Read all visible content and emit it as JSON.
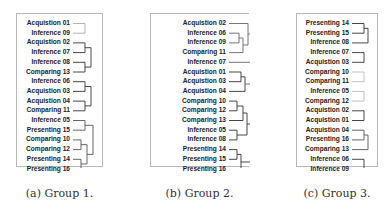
{
  "panels": [
    {
      "id": "a",
      "caption": "(a) Group 1.",
      "labels": [
        "Acquistion 01",
        "Inference 09",
        "Acquistion 02",
        "Inference 07",
        "Inference 08",
        "Comparing 13",
        "Inference 06",
        "Acquistion 03",
        "Acquistion 04",
        "Comparing 11",
        "Inference 05",
        "Presenting 15",
        "Comparing 10",
        "Comparing 12",
        "Presenting 14",
        "Presenting 16"
      ],
      "clusters": [
        {
          "leaves": [
            0,
            1
          ],
          "color": "#aaaaaa"
        },
        {
          "leaves": [
            2,
            3,
            4,
            5
          ],
          "color": "#333333"
        },
        {
          "leaves": [
            6,
            7,
            8,
            9
          ],
          "color": "#333333"
        },
        {
          "leaves": [
            10,
            11,
            12,
            13,
            14,
            15
          ],
          "color": "#555555"
        }
      ]
    },
    {
      "id": "b",
      "caption": "(b) Group 2.",
      "labels": [
        "Acquistion 02",
        "Inference 06",
        "Inference 09",
        "Comparing 11",
        "Inference 07",
        "Acquistion 01",
        "Acquistion 03",
        "Acquistion 04",
        "Comparing 10",
        "Comparing 12",
        "Comparing 13",
        "Inference 05",
        "Inference 08",
        "Presenting 14",
        "Presenting 15",
        "Presenting 16"
      ],
      "clusters": [
        {
          "leaves": [
            0,
            1,
            2,
            3,
            4,
            5,
            6,
            7
          ],
          "color": "#666666"
        },
        {
          "leaves": [
            8,
            9,
            10,
            11,
            12,
            13,
            14,
            15
          ],
          "color": "#333333"
        }
      ]
    },
    {
      "id": "c",
      "caption": "(c) Group 3.",
      "labels": [
        "Presenting 14",
        "Presenting 15",
        "Inference 08",
        "Inference 07",
        "Acquistion 03",
        "Comparing 10",
        "Comparing 11",
        "Inference 05",
        "Comparing 12",
        "Acquistion 02",
        "Acquistion 01",
        "Acquistion 04",
        "Presenting 16",
        "Comparing 13",
        "Inference 06",
        "Inference 09"
      ],
      "clusters": [
        {
          "leaves": [
            0,
            1,
            2
          ],
          "color": "#333333"
        },
        {
          "leaves": [
            3,
            4
          ],
          "color": "#333333"
        },
        {
          "leaves": [
            5,
            6
          ],
          "color": "#bbbbbb"
        },
        {
          "leaves": [
            7,
            8
          ],
          "color": "#bbbbbb"
        },
        {
          "leaves": [
            9,
            10
          ],
          "color": "#333333"
        },
        {
          "leaves": [
            11,
            12,
            13
          ],
          "color": "#555555"
        },
        {
          "leaves": [
            14,
            15
          ],
          "color": "#333333"
        }
      ]
    }
  ]
}
